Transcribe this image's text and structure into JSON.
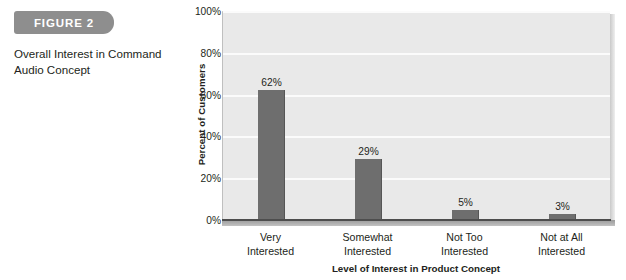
{
  "figure": {
    "badge_label": "FIGURE 2",
    "caption": "Overall Interest in Command Audio Concept",
    "badge_color": "#8e8e8e"
  },
  "chart_data": {
    "type": "bar",
    "title": "",
    "categories": [
      "Very Interested",
      "Somewhat Interested",
      "Not Too Interested",
      "Not at All Interested"
    ],
    "category_lines": [
      [
        "Very",
        "Interested"
      ],
      [
        "Somewhat",
        "Interested"
      ],
      [
        "Not Too",
        "Interested"
      ],
      [
        "Not at All",
        "Interested"
      ]
    ],
    "values": [
      62,
      29,
      5,
      3
    ],
    "value_labels": [
      "62%",
      "29%",
      "5%",
      "3%"
    ],
    "xlabel": "Level of Interest in Product Concept",
    "ylabel": "Percent of Customers",
    "ylim": [
      0,
      100
    ],
    "yticks": [
      0,
      20,
      40,
      60,
      80,
      100
    ],
    "ytick_labels": [
      "0%",
      "20%",
      "40%",
      "60%",
      "80%",
      "100%"
    ],
    "grid": true,
    "legend": false,
    "bar_color": "#6e6e6e",
    "plot_background": "#e9e9e9",
    "gridline_color": "#fbfbfb"
  }
}
